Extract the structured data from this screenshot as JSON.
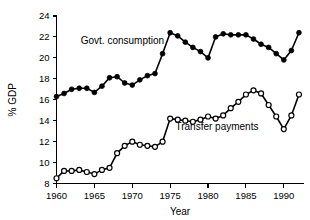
{
  "chart_data": {
    "type": "line",
    "title": "",
    "xlabel": "Year",
    "ylabel": "% GDP",
    "xlim": [
      1960,
      1992.6
    ],
    "ylim": [
      8,
      24
    ],
    "grid": false,
    "legend_position": "inline-annotations",
    "x_ticks": [
      1960,
      1965,
      1970,
      1975,
      1980,
      1985,
      1990
    ],
    "x_tick_labels": [
      "1960",
      "1965",
      "1970",
      "1975",
      "1980",
      "1985",
      "1990"
    ],
    "y_ticks": [
      8,
      10,
      12,
      14,
      16,
      18,
      20,
      22,
      24
    ],
    "y_tick_labels": [
      "8",
      "10",
      "12",
      "14",
      "16",
      "18",
      "20",
      "22",
      "24"
    ],
    "x": [
      1960,
      1961,
      1962,
      1963,
      1964,
      1965,
      1966,
      1967,
      1968,
      1969,
      1970,
      1971,
      1972,
      1973,
      1974,
      1975,
      1976,
      1977,
      1978,
      1979,
      1980,
      1981,
      1982,
      1983,
      1984,
      1985,
      1986,
      1987,
      1988,
      1989,
      1990,
      1991,
      1992
    ],
    "series": [
      {
        "name": "Govt. consumption",
        "marker": "filled-circle",
        "color": "#000000",
        "label_x": 1963.2,
        "label_y": 21.3,
        "values": [
          16.3,
          16.6,
          17.0,
          17.1,
          17.1,
          16.7,
          17.3,
          18.1,
          18.2,
          17.6,
          17.4,
          17.9,
          18.3,
          18.5,
          20.4,
          22.4,
          22.1,
          21.5,
          21.0,
          20.6,
          20.0,
          22.0,
          22.3,
          22.2,
          22.2,
          22.2,
          21.8,
          21.3,
          21.0,
          20.4,
          19.8,
          20.7,
          22.4
        ]
      },
      {
        "name": "Transfer payments",
        "marker": "open-circle",
        "color": "#000000",
        "label_x": 1975.7,
        "label_y": 13.1,
        "values": [
          8.5,
          9.2,
          9.2,
          9.3,
          9.1,
          8.9,
          9.3,
          9.5,
          10.9,
          11.6,
          12.0,
          11.7,
          11.6,
          11.5,
          12.0,
          14.2,
          14.1,
          14.0,
          13.9,
          14.1,
          14.4,
          14.2,
          14.5,
          15.2,
          15.8,
          16.5,
          16.9,
          16.6,
          15.5,
          14.4,
          13.2,
          14.5,
          16.5
        ]
      }
    ],
    "annotations": [
      {
        "text": "Govt. consumption",
        "x": 1963.2,
        "y": 21.3
      },
      {
        "text": "Transfer payments",
        "x": 1975.7,
        "y": 13.1
      }
    ]
  }
}
